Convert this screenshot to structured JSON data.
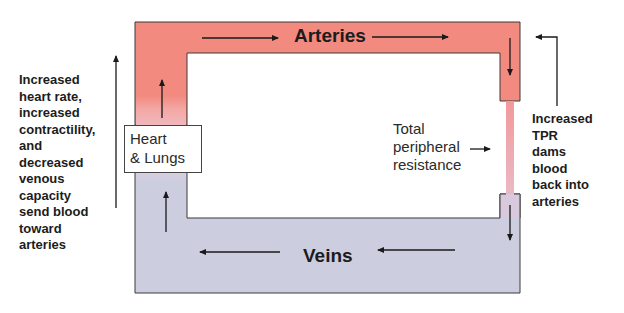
{
  "diagram": {
    "vessels": {
      "arteries": {
        "label": "Arteries",
        "color": "#f28a80"
      },
      "veins": {
        "label": "Veins",
        "color": "#cdcde0"
      },
      "resistance_segment_color": "#f0a7b0"
    },
    "heart_box": {
      "lines": [
        "Heart",
        "& Lungs"
      ]
    },
    "tpr_label": {
      "lines": [
        "Total",
        "peripheral",
        "resistance"
      ]
    },
    "left_annotation": {
      "lines": [
        "Increased",
        "heart rate,",
        "increased",
        "contractility,",
        "and",
        "decreased",
        "venous",
        "capacity",
        "send blood",
        "toward",
        "arteries"
      ]
    },
    "right_annotation": {
      "lines": [
        "Increased",
        "TPR",
        "dams",
        "blood",
        "back into",
        "arteries"
      ]
    },
    "colors": {
      "outline": "#3a3a3a",
      "arrow": "#1a1a1a",
      "background": "#ffffff"
    }
  }
}
